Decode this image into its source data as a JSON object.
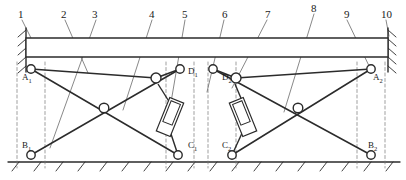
{
  "diagram": {
    "colors": {
      "line": "#2b2b2b",
      "thin_line": "#555555",
      "dashed": "#777777",
      "background": "#ffffff"
    },
    "callouts": [
      {
        "id": "c1",
        "label": "1",
        "x": 18,
        "y": 8,
        "leader": [
          [
            22,
            20
          ],
          [
            31,
            38
          ]
        ]
      },
      {
        "id": "c2",
        "label": "2",
        "x": 61,
        "y": 8,
        "leader": [
          [
            65,
            20
          ],
          [
            88,
            73
          ]
        ]
      },
      {
        "id": "c3",
        "label": "3",
        "x": 92,
        "y": 8,
        "leader": [
          [
            96,
            20
          ],
          [
            50,
            148
          ]
        ]
      },
      {
        "id": "c4",
        "label": "4",
        "x": 149,
        "y": 8,
        "leader": [
          [
            152,
            20
          ],
          [
            123,
            110
          ]
        ]
      },
      {
        "id": "c5",
        "label": "5",
        "x": 182,
        "y": 8,
        "leader": [
          [
            185,
            20
          ],
          [
            168,
            120
          ]
        ]
      },
      {
        "id": "c6",
        "label": "6",
        "x": 222,
        "y": 8,
        "leader": [
          [
            224,
            20
          ],
          [
            207,
            92
          ]
        ]
      },
      {
        "id": "c7",
        "label": "7",
        "x": 265,
        "y": 8,
        "leader": [
          [
            267,
            20
          ],
          [
            232,
            88
          ]
        ]
      },
      {
        "id": "c8",
        "label": "8",
        "x": 311,
        "y": 2,
        "leader": [
          [
            314,
            14
          ],
          [
            284,
            112
          ]
        ]
      },
      {
        "id": "c9",
        "label": "9",
        "x": 344,
        "y": 8,
        "leader": [
          [
            347,
            20
          ],
          [
            371,
            70
          ]
        ]
      },
      {
        "id": "c10",
        "label": "10",
        "x": 381,
        "y": 8,
        "leader": [
          [
            386,
            20
          ],
          [
            389,
            36
          ]
        ]
      }
    ],
    "joint_labels": [
      {
        "id": "A1",
        "text": "A",
        "sub": "1",
        "x": 22,
        "y": 72
      },
      {
        "id": "B1",
        "text": "B",
        "sub": "1",
        "x": 22,
        "y": 140
      },
      {
        "id": "C1",
        "text": "C",
        "sub": "1",
        "x": 188,
        "y": 140
      },
      {
        "id": "D1",
        "text": "D",
        "sub": "1",
        "x": 188,
        "y": 66
      },
      {
        "id": "D2",
        "text": "D",
        "sub": "2",
        "x": 222,
        "y": 72
      },
      {
        "id": "C2",
        "text": "C",
        "sub": "2",
        "x": 222,
        "y": 140
      },
      {
        "id": "A2",
        "text": "A",
        "sub": "2",
        "x": 373,
        "y": 72
      },
      {
        "id": "B2",
        "text": "B",
        "sub": "2",
        "x": 368,
        "y": 140
      }
    ],
    "geometry": {
      "beam": {
        "x1": 26,
        "y1": 38,
        "x2": 388,
        "y2": 38,
        "x3": 388,
        "y3": 57,
        "x4": 26,
        "y4": 57
      },
      "ground_y": 162,
      "ground_x1": 8,
      "ground_x2": 400,
      "wall_left": {
        "x": 26,
        "y1": 28,
        "y2": 72
      },
      "wall_right": {
        "x": 388,
        "y1": 28,
        "y2": 72
      },
      "pivots": [
        {
          "name": "A1",
          "x": 31,
          "y": 69,
          "r": 4.2
        },
        {
          "name": "B1",
          "x": 31,
          "y": 155,
          "r": 4.2
        },
        {
          "name": "C1",
          "x": 178,
          "y": 155,
          "r": 4.2
        },
        {
          "name": "D1",
          "x": 180,
          "y": 69,
          "r": 4.2
        },
        {
          "name": "mid1",
          "x": 104,
          "y": 108,
          "r": 4.8
        },
        {
          "name": "knee1",
          "x": 156,
          "y": 78,
          "r": 5.0
        },
        {
          "name": "D2",
          "x": 213,
          "y": 69,
          "r": 4.2
        },
        {
          "name": "C2",
          "x": 232,
          "y": 155,
          "r": 4.2
        },
        {
          "name": "A2",
          "x": 371,
          "y": 69,
          "r": 4.2
        },
        {
          "name": "B2",
          "x": 371,
          "y": 155,
          "r": 4.2
        },
        {
          "name": "mid2",
          "x": 298,
          "y": 108,
          "r": 4.8
        },
        {
          "name": "knee2",
          "x": 236,
          "y": 78,
          "r": 5.0
        }
      ],
      "links_left": [
        [
          31,
          69,
          178,
          155
        ],
        [
          31,
          155,
          180,
          69
        ],
        [
          31,
          69,
          156,
          78
        ],
        [
          156,
          78,
          180,
          69
        ]
      ],
      "links_right": [
        [
          371,
          69,
          232,
          155
        ],
        [
          371,
          155,
          213,
          69
        ],
        [
          371,
          69,
          236,
          78
        ],
        [
          236,
          78,
          213,
          69
        ]
      ],
      "cylinder_left": {
        "cx": 170,
        "cy": 117,
        "angle": 22,
        "w": 15,
        "h": 36,
        "rod_to": [
          178,
          155
        ],
        "pin_from": [
          158,
          84
        ]
      },
      "cylinder_right": {
        "cx": 243,
        "cy": 117,
        "angle": -22,
        "w": 15,
        "h": 36,
        "rod_to": [
          232,
          155
        ],
        "pin_from": [
          235,
          84
        ]
      },
      "dashed_verticals": [
        {
          "x": 17,
          "y1": 62,
          "y2": 168
        },
        {
          "x": 45,
          "y1": 62,
          "y2": 168
        },
        {
          "x": 166,
          "y1": 62,
          "y2": 168
        },
        {
          "x": 194,
          "y1": 62,
          "y2": 168
        },
        {
          "x": 208,
          "y1": 62,
          "y2": 168
        },
        {
          "x": 236,
          "y1": 62,
          "y2": 168
        },
        {
          "x": 357,
          "y1": 62,
          "y2": 168
        },
        {
          "x": 385,
          "y1": 62,
          "y2": 168
        }
      ]
    }
  }
}
